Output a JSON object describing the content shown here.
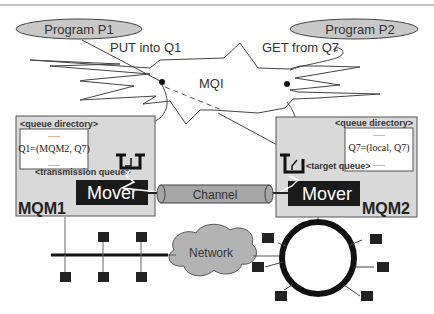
{
  "diagram": {
    "programs": [
      {
        "id": "p1",
        "label": "Program P1"
      },
      {
        "id": "p2",
        "label": "Program P2"
      }
    ],
    "actions": {
      "put": "PUT  into Q1",
      "get": "GET from Q7"
    },
    "mqi": {
      "label": "MQI"
    },
    "queue_managers": [
      {
        "id": "mqm1",
        "name": "MQM1",
        "directory_label": "<queue directory>",
        "directory_lines": [
          "......",
          "Q1=(MQM2, Q7)",
          "......"
        ],
        "queue_label": "<transmission queue>",
        "mover_label": "Mover"
      },
      {
        "id": "mqm2",
        "name": "MQM2",
        "directory_label": "<queue directory>",
        "directory_lines": [
          "......",
          "Q7=(local, Q7)",
          "......"
        ],
        "queue_label": "<target queue>",
        "mover_label": "Mover"
      }
    ],
    "channel": {
      "label": "Channel"
    },
    "network": {
      "label": "Network"
    },
    "colors": {
      "ellipse_fill": "#c8c8c8",
      "box_fill": "#d9d9d9",
      "mover_fill": "#1a1a1a",
      "channel_fill": "#a6a6a6",
      "cloud_fill": "#b3b3b3",
      "node_fill": "#222222"
    }
  }
}
